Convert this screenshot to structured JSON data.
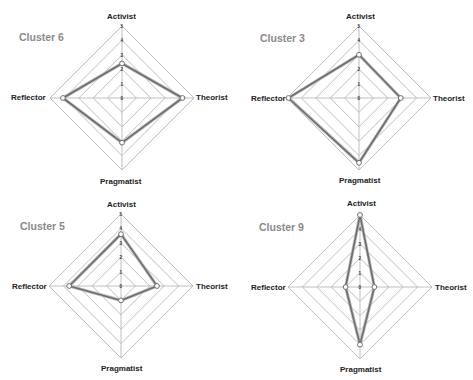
{
  "chart_data": [
    {
      "type": "radar",
      "title": "Cluster 6",
      "categories": [
        "Activist",
        "Theorist",
        "Pragmatist",
        "Reflector"
      ],
      "values": [
        2.4,
        4.2,
        3.1,
        4.1
      ],
      "radial_ticks": [
        "0",
        "1",
        "2",
        "3",
        "4",
        "5"
      ],
      "rlim": [
        0,
        5
      ]
    },
    {
      "type": "radar",
      "title": "Cluster 3",
      "categories": [
        "Activist",
        "Theorist",
        "Pragmatist",
        "Reflector"
      ],
      "values": [
        3.0,
        2.9,
        4.5,
        4.9
      ],
      "radial_ticks": [
        "0",
        "1",
        "2",
        "3",
        "4",
        "5"
      ],
      "rlim": [
        0,
        5
      ]
    },
    {
      "type": "radar",
      "title": "Cluster 5",
      "categories": [
        "Activist",
        "Theorist",
        "Pragmatist",
        "Reflector"
      ],
      "values": [
        3.6,
        2.5,
        1.0,
        3.6
      ],
      "radial_ticks": [
        "0",
        "1",
        "2",
        "3",
        "4",
        "5"
      ],
      "rlim": [
        0,
        5
      ]
    },
    {
      "type": "radar",
      "title": "Cluster 9",
      "categories": [
        "Activist",
        "Theorist",
        "Pragmatist",
        "Reflector"
      ],
      "values": [
        5.0,
        1.0,
        4.0,
        1.0
      ],
      "radial_ticks": [
        "0",
        "1",
        "2",
        "3",
        "4",
        "5"
      ],
      "rlim": [
        0,
        5
      ]
    }
  ],
  "panels": [
    {
      "title": "Cluster 6",
      "axes": {
        "top": "Activist",
        "right": "Theorist",
        "bottom": "Pragmatist",
        "left": "Reflector"
      }
    },
    {
      "title": "Cluster 3",
      "axes": {
        "top": "Activist",
        "right": "Theorist",
        "bottom": "Pragmatist",
        "left": "Reflector"
      }
    },
    {
      "title": "Cluster 5",
      "axes": {
        "top": "Activist",
        "right": "Theorist",
        "bottom": "Pragmatist",
        "left": "Reflector"
      }
    },
    {
      "title": "Cluster 9",
      "axes": {
        "top": "Activist",
        "right": "Theorist",
        "bottom": "Pragmatist",
        "left": "Reflector"
      }
    }
  ],
  "ticks": [
    "0",
    "1",
    "2",
    "3",
    "4",
    "5"
  ],
  "colors": {
    "grid": "#b8b8b8",
    "series": "#6e6e6e",
    "title": "#8a8a8a"
  }
}
